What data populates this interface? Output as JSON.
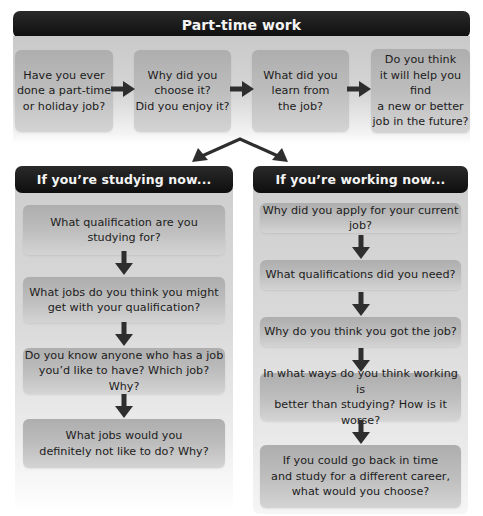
{
  "title": "Part-time work",
  "top_flow": [
    {
      "text": "Have you ever\ndone a part-time\nor holiday job?"
    },
    {
      "text": "Why did you\nchoose it?\nDid you enjoy it?"
    },
    {
      "text": "What did you\nlearn from\nthe job?"
    },
    {
      "text": "Do you think\nit will help you find\na new or better\njob in the future?"
    }
  ],
  "branches": {
    "studying": {
      "title": "If you’re studying now...",
      "steps": [
        {
          "text": "What qualification are you\nstudying for?"
        },
        {
          "text": "What jobs do you think you might\nget with your qualification?"
        },
        {
          "text": "Do you know anyone who has a job\nyou’d like to have? Which job? Why?"
        },
        {
          "text": "What jobs would you\ndefinitely not like to do? Why?"
        }
      ]
    },
    "working": {
      "title": "If you’re working now...",
      "steps": [
        {
          "text": "Why did you apply for your current job?"
        },
        {
          "text": "What qualifications did you need?"
        },
        {
          "text": "Why do you think you got the job?"
        },
        {
          "text": "In what ways do you think working is\nbetter than studying? How is it worse?"
        },
        {
          "text": "If you could go back in time\nand study for a different career,\nwhat would you choose?"
        }
      ]
    }
  },
  "icons": {
    "flow_arrow": "arrow-right-icon",
    "step_arrow": "arrow-down-icon",
    "branch_arrow": "branch-split-arrows-icon"
  },
  "colors": {
    "header_bg": "#141414",
    "header_text": "#f4f4f4",
    "panel_bg": "#d0d0d0",
    "box_bg": "#bcbcbc",
    "arrow": "#2e2e2e"
  }
}
